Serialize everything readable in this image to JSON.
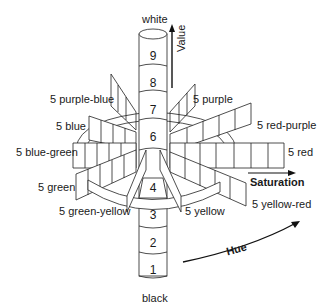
{
  "diagram": {
    "top_label": "white",
    "bottom_label": "black",
    "axes": {
      "value": "Value",
      "saturation": "Saturation",
      "hue": "Hue"
    },
    "value_steps": [
      "9",
      "8",
      "7",
      "6",
      "4",
      "3",
      "2",
      "1"
    ],
    "hues": {
      "purple_blue": "5 purple-blue",
      "purple": "5 purple",
      "blue": "5 blue",
      "red_purple": "5 red-purple",
      "blue_green": "5 blue-green",
      "red": "5 red",
      "green": "5 green",
      "yellow_red": "5 yellow-red",
      "green_yellow": "5 green-yellow",
      "yellow": "5 yellow"
    }
  }
}
